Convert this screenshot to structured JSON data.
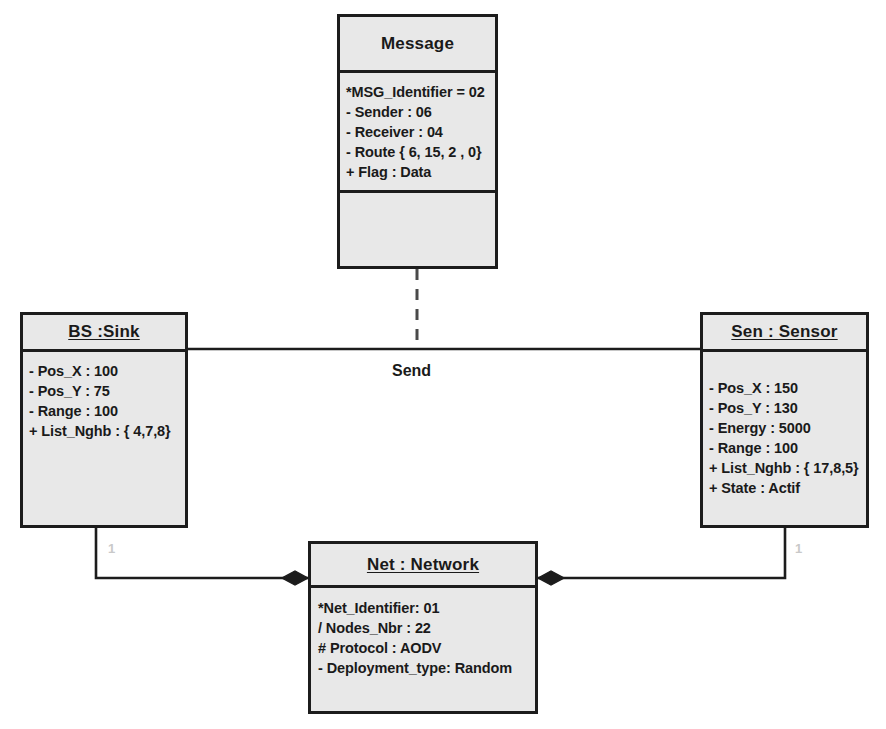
{
  "diagram": {
    "type": "uml-object-diagram",
    "background_color": "#ffffff",
    "box_fill_color": "#e8e8e8",
    "line_color": "#1c1c1c"
  },
  "classes": {
    "message": {
      "name": "Message",
      "name_underlined": false,
      "attributes": [
        "*MSG_Identifier = 02",
        "- Sender : 06",
        "- Receiver : 04",
        "- Route { 6, 15, 2 , 0}",
        "+ Flag : Data"
      ],
      "operations": []
    },
    "sink": {
      "name": "BS :Sink",
      "name_underlined": true,
      "attributes": [
        "- Pos_X : 100",
        "- Pos_Y : 75",
        "- Range : 100",
        "+ List_Nghb : { 4,7,8}"
      ],
      "operations": []
    },
    "sensor": {
      "name": "Sen : Sensor",
      "name_underlined": true,
      "attributes": [
        "- Pos_X : 150",
        "- Pos_Y : 130",
        "- Energy : 5000",
        "- Range : 100",
        "+ List_Nghb : { 17,8,5}",
        "+ State : Actif"
      ],
      "operations": []
    },
    "network": {
      "name": "Net : Network",
      "name_underlined": true,
      "attributes": [
        "*Net_Identifier: 01",
        "/ Nodes_Nbr : 22",
        "# Protocol : AODV",
        "- Deployment_type: Random"
      ],
      "operations": []
    }
  },
  "relationships": {
    "send_association": {
      "label": "Send",
      "from": "BS :Sink",
      "to": "Sen : Sensor",
      "style": "solid"
    },
    "message_link": {
      "label": "",
      "from": "Message",
      "to": "Send",
      "style": "dashed"
    },
    "sink_network_composition": {
      "label": "",
      "from": "BS :Sink",
      "to": "Net : Network",
      "style": "composition",
      "multiplicity": "1"
    },
    "sensor_network_composition": {
      "label": "",
      "from": "Sen : Sensor",
      "to": "Net : Network",
      "style": "composition",
      "multiplicity": "1"
    }
  }
}
